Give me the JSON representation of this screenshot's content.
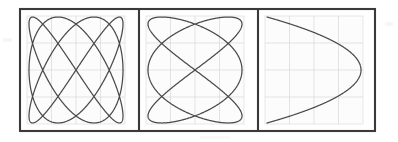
{
  "figure": {
    "background_color": "#ffffff",
    "frame_color": "#3a3a3a",
    "curve_color": "#4a4a4a",
    "grid_color": "#d9d9d9",
    "graticule_fill": "#fcfcfc",
    "frame": {
      "x": 20,
      "y": 9,
      "width": 355,
      "height": 122
    },
    "divider_x_positions": [
      139,
      258
    ]
  },
  "chart_data": {
    "type": "line",
    "xlabel": "",
    "ylabel": "",
    "grid": true,
    "legend_position": "none",
    "xlim": [
      -1,
      1
    ],
    "ylim": [
      -1,
      1
    ],
    "series": [
      {
        "name": "panel-1-lissajous",
        "panel": 1,
        "ratio_label": "3:4",
        "freq_x": 3,
        "freq_y": 4,
        "phase_deg": 90,
        "horizontal_tangent_points": 3,
        "vertical_tangent_points": 4,
        "grid_divisions": 4
      },
      {
        "name": "panel-2-lissajous",
        "panel": 2,
        "ratio_label": "3:2",
        "freq_x": 3,
        "freq_y": 2,
        "phase_deg": 90,
        "horizontal_tangent_points": 2,
        "vertical_tangent_points": 3,
        "grid_divisions": 4
      },
      {
        "name": "panel-3-lissajous",
        "panel": 3,
        "ratio_label": "2:1",
        "freq_x": 2,
        "freq_y": 1,
        "phase_deg": 90,
        "horizontal_tangent_points": 1,
        "vertical_tangent_points": 2,
        "grid_divisions": 4
      }
    ]
  },
  "panels": [
    {
      "name": "panel-1",
      "graticule": {
        "x": 27,
        "y": 16,
        "width": 98,
        "height": 108
      },
      "curve_box": {
        "x": 29,
        "y": 17,
        "width": 94,
        "height": 106
      },
      "ratio_label": "3:4"
    },
    {
      "name": "panel-2",
      "graticule": {
        "x": 146,
        "y": 16,
        "width": 98,
        "height": 108
      },
      "curve_box": {
        "x": 148,
        "y": 17,
        "width": 94,
        "height": 106
      },
      "ratio_label": "3:2"
    },
    {
      "name": "panel-3",
      "graticule": {
        "x": 265,
        "y": 16,
        "width": 98,
        "height": 108
      },
      "curve_box": {
        "x": 267,
        "y": 17,
        "width": 94,
        "height": 106
      },
      "ratio_label": "2:1"
    }
  ]
}
